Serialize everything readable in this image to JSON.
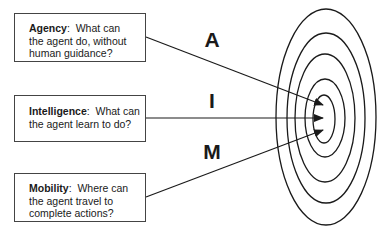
{
  "diagram": {
    "boxes": [
      {
        "term": "Agency",
        "text": "What can the agent do, without human guidance?",
        "line1": "What can",
        "line2": "the agent do, without",
        "line3": "human guidance?"
      },
      {
        "term": "Intelligence",
        "text": "What can the agent learn to do?",
        "line1": "What can",
        "line2": "the agent learn to do?"
      },
      {
        "term": "Mobility",
        "text": "Where can the agent travel to complete actions?",
        "line1": "Where can",
        "line2": "the agent travel to",
        "line3": "complete actions?"
      }
    ],
    "letters": [
      "A",
      "I",
      "M"
    ],
    "target": {
      "rings": 5
    }
  }
}
